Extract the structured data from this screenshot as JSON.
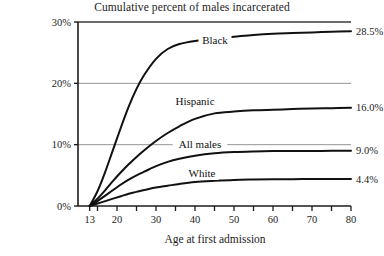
{
  "chart_data": {
    "type": "line",
    "title": "Cumulative percent of males incarcerated",
    "xlabel": "Age at first admission",
    "ylabel": "",
    "xlim": [
      10,
      80
    ],
    "ylim": [
      0,
      30
    ],
    "grid": true,
    "legend_position": "inline-right-of-curve",
    "x_tick_labels": [
      "13",
      "20",
      "30",
      "40",
      "50",
      "60",
      "70",
      "80"
    ],
    "x_tick_values": [
      13,
      20,
      30,
      40,
      50,
      60,
      70,
      80
    ],
    "x_minor_ticks": [
      15,
      20,
      25,
      30,
      35,
      40,
      45,
      50,
      55,
      60,
      65,
      70,
      75,
      80
    ],
    "y_tick_labels": [
      "0%",
      "10%",
      "20%",
      "30%"
    ],
    "y_tick_values": [
      0,
      10,
      20,
      30
    ],
    "x": [
      13,
      15,
      17,
      19,
      21,
      23,
      25,
      27,
      30,
      33,
      36,
      40,
      45,
      50,
      55,
      60,
      65,
      70,
      75,
      80
    ],
    "series": [
      {
        "name": "Black",
        "end_value_label": "28.5%",
        "end_value": 28.5,
        "color": "#111111",
        "values": [
          0,
          2.4,
          5.6,
          9.2,
          12.8,
          16.2,
          19.1,
          21.4,
          24.0,
          25.6,
          26.4,
          26.9,
          27.3,
          27.6,
          27.9,
          28.1,
          28.2,
          28.3,
          28.4,
          28.5
        ]
      },
      {
        "name": "Hispanic",
        "end_value_label": "16.0%",
        "end_value": 16.0,
        "color": "#111111",
        "values": [
          0,
          1.2,
          2.6,
          4.1,
          5.5,
          6.8,
          8.0,
          9.1,
          10.6,
          11.9,
          13.0,
          14.2,
          15.1,
          15.4,
          15.6,
          15.7,
          15.8,
          15.9,
          15.95,
          16.0
        ]
      },
      {
        "name": "All males",
        "end_value_label": "9.0%",
        "end_value": 9.0,
        "color": "#111111",
        "values": [
          0,
          0.8,
          1.7,
          2.6,
          3.5,
          4.3,
          5.0,
          5.6,
          6.5,
          7.2,
          7.7,
          8.2,
          8.6,
          8.8,
          8.9,
          8.95,
          8.97,
          8.98,
          8.99,
          9.0
        ]
      },
      {
        "name": "White",
        "end_value_label": "4.4%",
        "end_value": 4.4,
        "color": "#111111",
        "values": [
          0,
          0.4,
          0.8,
          1.2,
          1.6,
          2.0,
          2.3,
          2.6,
          3.0,
          3.3,
          3.6,
          3.9,
          4.1,
          4.25,
          4.32,
          4.36,
          4.38,
          4.39,
          4.4,
          4.4
        ]
      }
    ],
    "label_positions": [
      {
        "name": "Black",
        "x": 215,
        "y": 44
      },
      {
        "name": "Hispanic",
        "x": 195,
        "y": 105
      },
      {
        "name": "All males",
        "x": 200,
        "y": 148
      },
      {
        "name": "White",
        "x": 202,
        "y": 177
      }
    ]
  },
  "colors": {
    "axis": "#1c1c1c",
    "gridline": "#8a8a8a",
    "curve": "#111111",
    "background": "#ffffff",
    "text": "#1c1c1c"
  }
}
